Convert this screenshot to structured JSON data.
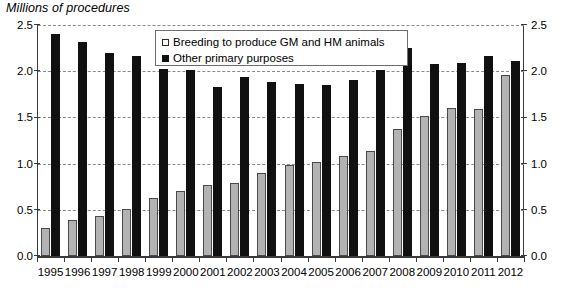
{
  "chart_data": {
    "type": "bar",
    "title": "Millions of procedures",
    "xlabel": "",
    "ylabel": "",
    "ylim": [
      0.0,
      2.5
    ],
    "yticks": [
      "0.0",
      "0.5",
      "1.0",
      "1.5",
      "2.0",
      "2.5"
    ],
    "ytick_values": [
      0.0,
      0.5,
      1.0,
      1.5,
      2.0,
      2.5
    ],
    "right_axis": true,
    "right_yticks": [
      "0.0",
      "0.5",
      "1.0",
      "1.5",
      "2.0",
      "2.5"
    ],
    "grid": true,
    "legend_position": "top-center",
    "categories": [
      "1995",
      "1996",
      "1997",
      "1998",
      "1999",
      "2000",
      "2001",
      "2002",
      "2003",
      "2004",
      "2005",
      "2006",
      "2007",
      "2008",
      "2009",
      "2010",
      "2011",
      "2012"
    ],
    "series": [
      {
        "name": "Breeding to produce GM and HM animals",
        "color": "#b3b3b3",
        "values": [
          0.3,
          0.39,
          0.43,
          0.51,
          0.63,
          0.7,
          0.77,
          0.79,
          0.9,
          0.98,
          1.02,
          1.08,
          1.14,
          1.37,
          1.51,
          1.6,
          1.59,
          1.96
        ]
      },
      {
        "name": "Other primary purposes",
        "color": "#101010",
        "values": [
          2.4,
          2.32,
          2.2,
          2.16,
          2.02,
          2.01,
          1.83,
          1.94,
          1.88,
          1.86,
          1.85,
          1.9,
          2.01,
          2.25,
          2.08,
          2.09,
          2.16,
          2.11
        ]
      }
    ]
  },
  "legend": {
    "items": [
      {
        "label": "Breeding to produce GM and HM animals",
        "swatch": "grey"
      },
      {
        "label": "Other primary purposes",
        "swatch": "black"
      }
    ]
  }
}
